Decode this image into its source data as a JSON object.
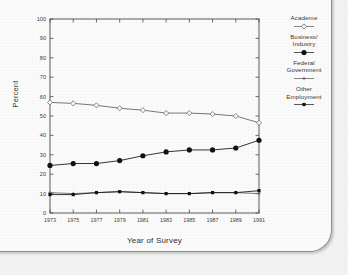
{
  "figure": {
    "y_axis_title": "Percent",
    "x_axis_title": "Year of Survey"
  },
  "legend": {
    "position": "right",
    "entries": [
      {
        "label": "Academe",
        "marker": "open-diamond-marker",
        "color": "#555555"
      },
      {
        "label": "Business/\nIndustry",
        "marker": "filled-circle-marker",
        "color": "#111111"
      },
      {
        "label": "Federal\nGovernment",
        "marker": "small-cross-marker",
        "color": "#555555"
      },
      {
        "label": "Other\nEmployment",
        "marker": "small-filled-square-marker",
        "color": "#111111"
      }
    ]
  },
  "chart_data": {
    "type": "line",
    "title": "",
    "xlabel": "Year of Survey",
    "ylabel": "Percent",
    "xlim": [
      1973,
      1991
    ],
    "ylim": [
      0,
      100
    ],
    "ytick_step": 10,
    "yticks": [
      0,
      10,
      20,
      30,
      40,
      50,
      60,
      70,
      80,
      90,
      100
    ],
    "grid": false,
    "x": [
      1973,
      1975,
      1977,
      1979,
      1981,
      1983,
      1985,
      1987,
      1989,
      1991
    ],
    "categories": [
      "1973",
      "1975",
      "1977",
      "1979",
      "1981",
      "1983",
      "1985",
      "1987",
      "1989",
      "1991"
    ],
    "series": [
      {
        "name": "Academe",
        "marker": "open-diamond",
        "color": "#606060",
        "values": [
          57,
          56.5,
          55.5,
          54,
          53,
          51.5,
          51.5,
          51,
          50,
          46.5
        ]
      },
      {
        "name": "Business/Industry",
        "marker": "filled-circle",
        "color": "#111111",
        "values": [
          24.5,
          25.5,
          25.5,
          27,
          29.5,
          31.5,
          32.5,
          32.5,
          33.5,
          37.5
        ]
      },
      {
        "name": "Federal Government",
        "marker": "small-cross",
        "color": "#606060",
        "values": [
          10.5,
          10,
          10.5,
          11,
          10.5,
          10,
          10,
          10.5,
          10.5,
          10
        ]
      },
      {
        "name": "Other Employment",
        "marker": "small-filled-square",
        "color": "#111111",
        "values": [
          9.5,
          9.5,
          10.5,
          11,
          10.5,
          10,
          10,
          10.5,
          10.5,
          11.5
        ]
      }
    ]
  }
}
